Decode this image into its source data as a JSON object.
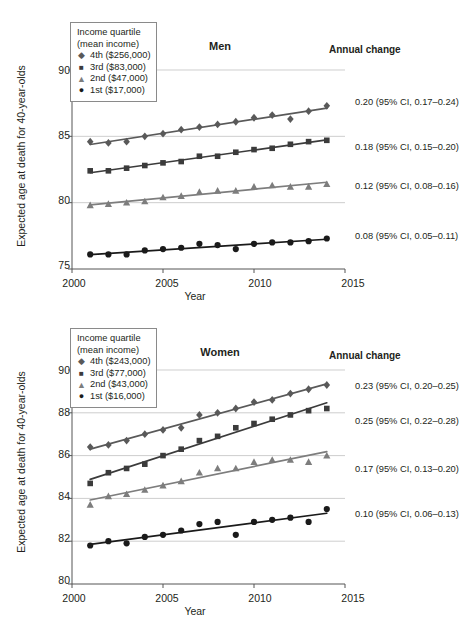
{
  "chart_data": [
    {
      "type": "scatter",
      "title": "Men",
      "xlabel": "Year",
      "ylabel": "Expected age at death for 40-year-olds",
      "xlim": [
        2000,
        2015
      ],
      "ylim": [
        75,
        90
      ],
      "xticks": [
        2000,
        2005,
        2010,
        2015
      ],
      "yticks": [
        75,
        80,
        85,
        90
      ],
      "grid": "horizontal",
      "legend_title": "Income quartile\n(mean income)",
      "legend_position": "top-left",
      "annotation_header": "Annual change",
      "x": [
        2001,
        2002,
        2003,
        2004,
        2005,
        2006,
        2007,
        2008,
        2009,
        2010,
        2011,
        2012,
        2013,
        2014
      ],
      "series": [
        {
          "name": "4th ($256,000)",
          "marker": "diamond",
          "color": "#595959",
          "values": [
            84.6,
            84.5,
            84.6,
            85.0,
            85.2,
            85.5,
            85.7,
            85.9,
            86.1,
            86.4,
            86.6,
            86.3,
            86.9,
            87.3
          ],
          "annual_change": "0.20 (95% CI, 0.17–0.24)"
        },
        {
          "name": "3rd ($83,000)",
          "marker": "square",
          "color": "#3b3b3b",
          "values": [
            82.4,
            82.4,
            82.6,
            82.8,
            83.0,
            83.1,
            83.5,
            83.5,
            83.8,
            84.0,
            84.1,
            84.4,
            84.6,
            84.7
          ],
          "annual_change": "0.18 (95% CI, 0.15–0.20)"
        },
        {
          "name": "2nd ($47,000)",
          "marker": "triangle",
          "color": "#7d7d7d",
          "values": [
            79.8,
            79.9,
            80.0,
            80.1,
            80.4,
            80.5,
            80.8,
            80.9,
            80.9,
            81.2,
            81.3,
            81.2,
            81.2,
            81.4
          ],
          "annual_change": "0.12 (95% CI, 0.08–0.16)"
        },
        {
          "name": "1st ($17,000)",
          "marker": "circle",
          "color": "#1a1a1a",
          "values": [
            76.1,
            76.1,
            76.1,
            76.4,
            76.5,
            76.6,
            76.9,
            76.8,
            76.5,
            76.9,
            77.0,
            77.0,
            77.1,
            77.3
          ],
          "annual_change": "0.08 (95% CI, 0.05–0.11)"
        }
      ]
    },
    {
      "type": "scatter",
      "title": "Women",
      "xlabel": "Year",
      "ylabel": "Expected age at death for 40-year-olds",
      "xlim": [
        2000,
        2015
      ],
      "ylim": [
        80,
        90
      ],
      "xticks": [
        2000,
        2005,
        2010,
        2015
      ],
      "yticks": [
        80,
        82,
        84,
        86,
        88,
        90
      ],
      "grid": "horizontal",
      "legend_title": "Income quartile\n(mean income)",
      "legend_position": "top-left",
      "annotation_header": "Annual change",
      "x": [
        2001,
        2002,
        2003,
        2004,
        2005,
        2006,
        2007,
        2008,
        2009,
        2010,
        2011,
        2012,
        2013,
        2014
      ],
      "series": [
        {
          "name": "4th ($243,000)",
          "marker": "diamond",
          "color": "#595959",
          "values": [
            86.4,
            86.5,
            86.7,
            87.0,
            87.2,
            87.3,
            87.9,
            88.0,
            88.2,
            88.5,
            88.6,
            88.9,
            89.1,
            89.3
          ],
          "annual_change": "0.23 (95% CI, 0.20–0.25)"
        },
        {
          "name": "3rd ($77,000)",
          "marker": "square",
          "color": "#3b3b3b",
          "values": [
            84.7,
            85.2,
            85.4,
            85.6,
            86.0,
            86.3,
            86.7,
            86.9,
            87.3,
            87.5,
            87.7,
            87.9,
            88.1,
            88.2
          ],
          "annual_change": "0.25 (95% CI, 0.22–0.28)"
        },
        {
          "name": "2nd ($43,000)",
          "marker": "triangle",
          "color": "#7d7d7d",
          "values": [
            83.7,
            84.1,
            84.2,
            84.4,
            84.6,
            84.8,
            85.2,
            85.4,
            85.4,
            85.7,
            85.8,
            85.8,
            85.7,
            86.0
          ],
          "annual_change": "0.17 (95% CI, 0.13–0.20)"
        },
        {
          "name": "1st ($16,000)",
          "marker": "circle",
          "color": "#1a1a1a",
          "values": [
            81.8,
            82.0,
            81.9,
            82.2,
            82.3,
            82.5,
            82.8,
            82.9,
            82.3,
            82.9,
            83.0,
            83.1,
            82.9,
            83.5
          ],
          "annual_change": "0.10 (95% CI, 0.06–0.13)"
        }
      ]
    }
  ],
  "legend_markers": {
    "diamond": "◆",
    "square": "■",
    "triangle": "▲",
    "circle": "●"
  }
}
